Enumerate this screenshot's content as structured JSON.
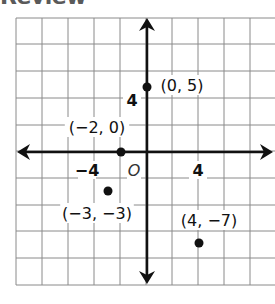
{
  "header": {
    "title": "Review"
  },
  "plane": {
    "grid": {
      "x_lines": [
        16,
        42,
        68,
        94,
        120,
        146,
        172,
        198,
        224,
        250,
        276
      ],
      "y_lines": [
        18,
        44,
        71,
        98,
        125,
        151,
        178,
        205,
        231,
        258,
        285
      ],
      "left": 16,
      "right": 276,
      "top": 18,
      "bottom": 285,
      "units_per_cell": 2,
      "line_color": "#8a8a8a"
    },
    "axes": {
      "origin_px": [
        147,
        152
      ],
      "px_per_unit": 13,
      "color": "#111111",
      "x_arrow_left": 17,
      "x_arrow_right": 273,
      "y_arrow_top": 18,
      "y_arrow_bottom": 284
    },
    "tick_labels": [
      {
        "text": "4",
        "axis": "y",
        "x": 132,
        "y": 106
      },
      {
        "text": "−4",
        "axis": "x",
        "x": 87,
        "y": 176
      },
      {
        "text": "4",
        "axis": "x",
        "x": 198,
        "y": 176
      }
    ],
    "origin_label": {
      "text": "O",
      "x": 134,
      "y": 176
    },
    "points": [
      {
        "label": "(0, 5)",
        "x": 0,
        "y": 5,
        "label_x": 182,
        "label_y": 91
      },
      {
        "label": "(−2, 0)",
        "x": -2,
        "y": 0,
        "label_x": 97,
        "label_y": 133
      },
      {
        "label": "(−3, −3)",
        "x": -3,
        "y": -3,
        "label_x": 97,
        "label_y": 219
      },
      {
        "label": "(4, −7)",
        "x": 4,
        "y": -7,
        "label_x": 209,
        "label_y": 226
      }
    ]
  },
  "chart_data": {
    "type": "scatter",
    "title": "",
    "xlabel": "",
    "ylabel": "",
    "origin_label": "O",
    "x_tick_labels": [
      "−4",
      "4"
    ],
    "y_tick_labels": [
      "4"
    ],
    "grid": true,
    "grid_step": 2,
    "xlim": [
      -10,
      10
    ],
    "ylim": [
      -10,
      10
    ],
    "series": [
      {
        "name": "points",
        "x": [
          0,
          -2,
          -3,
          4
        ],
        "y": [
          5,
          0,
          -3,
          -7
        ],
        "labels": [
          "(0, 5)",
          "(−2, 0)",
          "(−3, −3)",
          "(4, −7)"
        ]
      }
    ]
  }
}
